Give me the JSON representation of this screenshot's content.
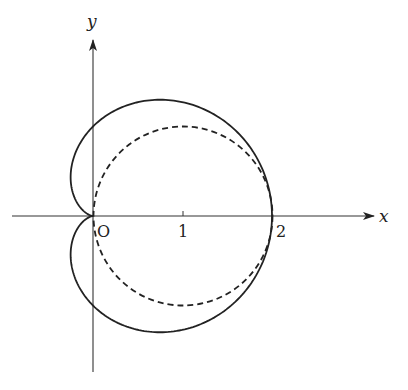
{
  "diagram": {
    "type": "polar-curve-plot",
    "axes": {
      "x_label": "x",
      "y_label": "y",
      "origin_label": "O",
      "ticks": [
        {
          "value": 1,
          "label": "1"
        },
        {
          "value": 2,
          "label": "2"
        }
      ]
    },
    "curves": [
      {
        "name": "cardioid",
        "equation": "r = 1 + cos θ",
        "style": "solid",
        "color": "#222222"
      },
      {
        "name": "circle",
        "equation": "r = 2 cos θ",
        "style": "dashed",
        "color": "#222222"
      }
    ]
  }
}
